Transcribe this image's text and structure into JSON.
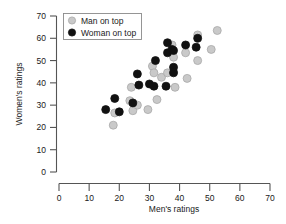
{
  "chart_data": {
    "type": "scatter",
    "title": "",
    "xlabel": "Men's ratings",
    "ylabel": "Women's ratings",
    "xlim": [
      0,
      70
    ],
    "ylim": [
      0,
      70
    ],
    "xticks": [
      0,
      10,
      20,
      30,
      40,
      50,
      60,
      70
    ],
    "yticks": [
      0,
      10,
      20,
      30,
      40,
      50,
      60,
      70
    ],
    "grid": false,
    "legend_position": "top-left",
    "series": [
      {
        "name": "Man on top",
        "marker": "filled-circle-gray",
        "color": "#c9c9c9",
        "edge_color": "#a8a8a8",
        "points": [
          [
            18.0,
            21.0
          ],
          [
            18.5,
            26.5
          ],
          [
            23.5,
            32.0
          ],
          [
            24.5,
            27.5
          ],
          [
            24.0,
            38.0
          ],
          [
            26.0,
            30.0
          ],
          [
            29.5,
            28.0
          ],
          [
            31.0,
            47.5
          ],
          [
            31.5,
            44.5
          ],
          [
            32.5,
            32.5
          ],
          [
            34.0,
            42.5
          ],
          [
            36.0,
            44.5
          ],
          [
            37.5,
            57.0
          ],
          [
            38.0,
            51.5
          ],
          [
            38.0,
            45.0
          ],
          [
            38.5,
            38.0
          ],
          [
            42.0,
            53.5
          ],
          [
            42.5,
            42.0
          ],
          [
            46.0,
            61.5
          ],
          [
            46.0,
            50.0
          ],
          [
            50.5,
            55.0
          ],
          [
            52.5,
            63.5
          ]
        ]
      },
      {
        "name": "Woman on top",
        "marker": "filled-circle-black",
        "color": "#111111",
        "edge_color": "#111111",
        "points": [
          [
            15.5,
            28.0
          ],
          [
            18.5,
            33.0
          ],
          [
            20.0,
            27.0
          ],
          [
            24.5,
            31.0
          ],
          [
            26.0,
            44.0
          ],
          [
            26.5,
            39.0
          ],
          [
            30.0,
            39.5
          ],
          [
            31.5,
            38.5
          ],
          [
            32.0,
            50.0
          ],
          [
            35.5,
            38.5
          ],
          [
            36.0,
            58.0
          ],
          [
            36.0,
            53.5
          ],
          [
            37.5,
            55.0
          ],
          [
            38.0,
            54.5
          ],
          [
            38.0,
            47.0
          ],
          [
            38.0,
            44.5
          ],
          [
            42.0,
            57.0
          ],
          [
            45.5,
            56.0
          ],
          [
            46.0,
            60.0
          ]
        ]
      }
    ]
  },
  "legend": {
    "items": [
      {
        "label": "Man on top",
        "marker": "gray-circle"
      },
      {
        "label": "Woman on top",
        "marker": "black-circle"
      }
    ]
  },
  "axes": {
    "x_title": "Men's ratings",
    "y_title": "Women's ratings",
    "x_tick_labels": [
      "0",
      "10",
      "20",
      "30",
      "40",
      "50",
      "60",
      "70"
    ],
    "y_tick_labels": [
      "0",
      "10",
      "20",
      "30",
      "40",
      "50",
      "60",
      "70"
    ]
  },
  "colors": {
    "gray_marker": "#c9c9c9",
    "gray_marker_edge": "#a8a8a8",
    "black_marker": "#111111",
    "axis": "#555555",
    "text": "#1a1a1a",
    "background": "#ffffff"
  }
}
